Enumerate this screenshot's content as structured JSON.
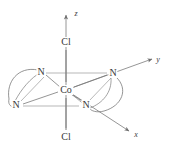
{
  "figure": {
    "background_color": "#ffffff",
    "line_color": "#6e6e6e",
    "text_color": "#3a3a3a"
  },
  "atoms": {
    "center": {
      "label": "Co",
      "x": 66,
      "y": 90
    },
    "axial_top": {
      "label": "Cl",
      "x": 66,
      "y": 42
    },
    "axial_bottom": {
      "label": "Cl",
      "x": 66,
      "y": 137
    },
    "n_upper_left": {
      "label": "N",
      "x": 41,
      "y": 72
    },
    "n_lower_left": {
      "label": "N",
      "x": 16,
      "y": 105
    },
    "n_upper_right": {
      "label": "N",
      "x": 113,
      "y": 73
    },
    "n_lower_right": {
      "label": "N",
      "x": 86,
      "y": 105
    }
  },
  "axes": {
    "z": {
      "label": "z",
      "x": 76,
      "y": 14
    },
    "y": {
      "label": "y",
      "x": 158,
      "y": 60
    },
    "x": {
      "label": "x",
      "x": 136,
      "y": 135
    }
  },
  "bonds": [
    {
      "name": "co-axial-top",
      "from": "Co",
      "to": "Cl"
    },
    {
      "name": "co-axial-bottom",
      "from": "Co",
      "to": "Cl"
    },
    {
      "name": "co-n-upper-left",
      "from": "Co",
      "to": "N"
    },
    {
      "name": "co-n-lower-left",
      "from": "Co",
      "to": "N"
    },
    {
      "name": "co-n-upper-right",
      "from": "Co",
      "to": "N"
    },
    {
      "name": "co-n-lower-right",
      "from": "Co",
      "to": "N"
    }
  ],
  "chelate_rings": [
    {
      "name": "left-chelate",
      "connects": [
        "N",
        "N"
      ]
    },
    {
      "name": "right-chelate",
      "connects": [
        "N",
        "N"
      ]
    }
  ]
}
